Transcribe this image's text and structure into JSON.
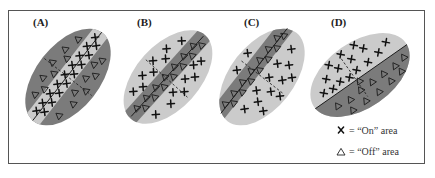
{
  "figure": {
    "frame": {
      "x": 8,
      "y": 10,
      "width": 416,
      "height": 154,
      "stroke": "#555555"
    },
    "colors": {
      "dark_gray": "#7b7b7b",
      "light_gray": "#cbcbcb",
      "symbol": "#111111"
    },
    "panels": [
      {
        "id": "A",
        "label": "(A)",
        "description": "On-center strip (light) flanked by off surround (dark)",
        "center": [
          68,
          77
        ],
        "rx": 56,
        "ry": 32,
        "angle": -52,
        "outer_fill": "dark",
        "strip_fill": "light",
        "strip_ry": 9,
        "strip_symbol": "x",
        "outer_symbol": "triangle"
      },
      {
        "id": "B",
        "label": "(B)",
        "description": "Off-center strip (dark) flanked by on surround (light)",
        "center": [
          168,
          77
        ],
        "rx": 56,
        "ry": 32,
        "angle": -48,
        "outer_fill": "light",
        "strip_fill": "dark",
        "strip_ry": 9,
        "strip_symbol": "triangle",
        "outer_symbol": "x"
      },
      {
        "id": "C",
        "label": "(C)",
        "description": "Off-center strip (dark) with on surround (light), different orientation",
        "center": [
          262,
          77
        ],
        "rx": 56,
        "ry": 32,
        "angle": -52,
        "outer_fill": "light",
        "strip_fill": "dark",
        "strip_ry": 9,
        "strip_symbol": "triangle",
        "outer_symbol": "x"
      },
      {
        "id": "D",
        "label": "(D)",
        "description": "Edge detector: on half (light, upper-left) and off half (dark, lower-right)",
        "center": [
          360,
          75
        ],
        "rx": 56,
        "ry": 33,
        "angle": -35,
        "upper_fill": "light",
        "lower_fill": "dark",
        "upper_symbol": "x",
        "lower_symbol": "triangle"
      }
    ],
    "legend": {
      "items": [
        {
          "symbol": "x",
          "symbol_glyph": "X",
          "text": "= “On” area"
        },
        {
          "symbol": "triangle",
          "symbol_glyph": "△",
          "text": "= “Off” area"
        }
      ]
    }
  }
}
